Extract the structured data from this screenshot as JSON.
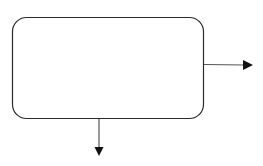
{
  "diagram": {
    "width": 263,
    "height": 166,
    "background": "#ffffff",
    "stroke_color": "#2a2a2a",
    "box": {
      "x": 12.5,
      "y": 17.5,
      "width": 191,
      "height": 101,
      "radius": 14,
      "label": ""
    },
    "arrows": [
      {
        "id": "right-output",
        "direction": "right",
        "x1": 204,
        "y1": 64.5,
        "x2": 244,
        "y2": 65,
        "head": [
          [
            243,
            60
          ],
          [
            253,
            65
          ],
          [
            243,
            70
          ]
        ]
      },
      {
        "id": "bottom-output",
        "direction": "down",
        "x1": 99,
        "y1": 119,
        "x2": 99,
        "y2": 148,
        "head": [
          [
            94.5,
            147
          ],
          [
            103.5,
            147
          ],
          [
            99,
            156
          ]
        ]
      }
    ]
  }
}
